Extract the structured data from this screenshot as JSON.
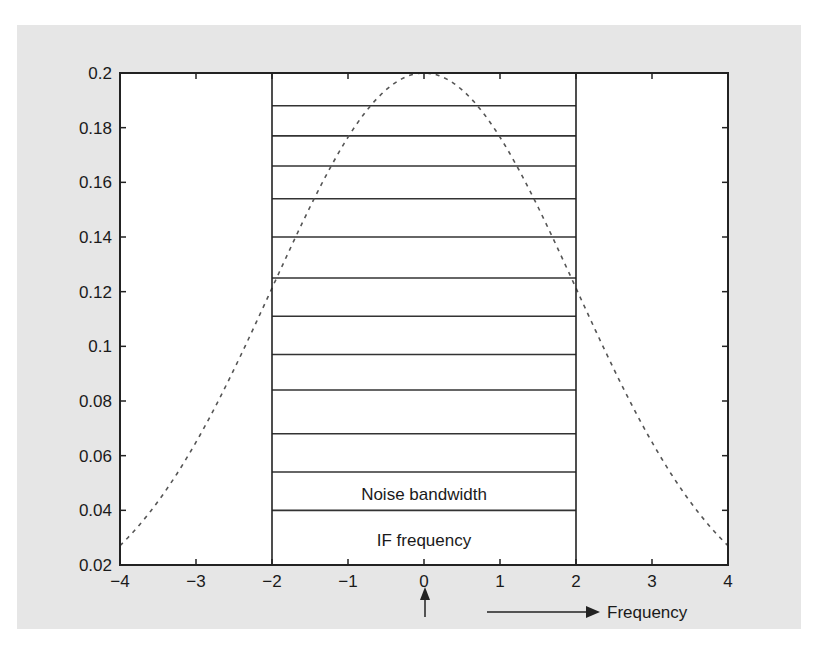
{
  "chart_data": {
    "type": "line",
    "title": "",
    "xlabel": "Frequency",
    "ylabel": "",
    "xlim": [
      -4,
      4
    ],
    "ylim": [
      0.02,
      0.2
    ],
    "grid": false,
    "x_ticks": [
      -4,
      -3,
      -2,
      -1,
      0,
      1,
      2,
      3,
      4
    ],
    "x_tick_labels": [
      "−4",
      "−3",
      "−2",
      "−1",
      "0",
      "1",
      "2",
      "3",
      "4"
    ],
    "y_ticks": [
      0.02,
      0.04,
      0.06,
      0.08,
      0.1,
      0.12,
      0.14,
      0.16,
      0.18,
      0.2
    ],
    "y_tick_labels": [
      "0.02",
      "0.04",
      "0.06",
      "0.08",
      "0.1",
      "0.12",
      "0.14",
      "0.16",
      "0.18",
      "0.2"
    ],
    "series": [
      {
        "name": "Gaussian response (dashed)",
        "style": "dashed",
        "x": [
          -4,
          -3.5,
          -3,
          -2.5,
          -2,
          -1.5,
          -1,
          -0.5,
          0,
          0.5,
          1,
          1.5,
          2,
          2.5,
          3,
          3.5,
          4
        ],
        "values": [
          0.027,
          0.043,
          0.065,
          0.092,
          0.121,
          0.151,
          0.176,
          0.194,
          0.2,
          0.194,
          0.176,
          0.151,
          0.121,
          0.092,
          0.065,
          0.043,
          0.027
        ]
      }
    ],
    "noise_band": {
      "x_range": [
        -2,
        2
      ],
      "horizontal_lines_y": [
        0.04,
        0.054,
        0.068,
        0.084,
        0.097,
        0.111,
        0.125,
        0.14,
        0.154,
        0.166,
        0.177,
        0.188
      ]
    },
    "annotations": [
      {
        "text": "Noise bandwidth",
        "x": 0,
        "y": 0.047
      },
      {
        "text": "IF frequency",
        "x": 0,
        "y": 0.03
      },
      {
        "text": "Frequency",
        "type": "arrow-label"
      },
      {
        "text": "↑",
        "type": "up-arrow-at-zero"
      }
    ]
  },
  "labels": {
    "noise_bandwidth": "Noise bandwidth",
    "if_frequency": "IF frequency",
    "frequency": "Frequency"
  }
}
